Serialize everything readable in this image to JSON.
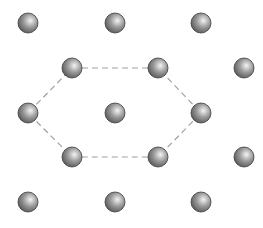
{
  "diagram": {
    "title": "",
    "atom_radius": 10,
    "atoms": [
      {
        "x": 28,
        "y": 23
      },
      {
        "x": 115,
        "y": 23
      },
      {
        "x": 201,
        "y": 23
      },
      {
        "x": 72,
        "y": 68
      },
      {
        "x": 158,
        "y": 68
      },
      {
        "x": 244,
        "y": 68
      },
      {
        "x": 28,
        "y": 113
      },
      {
        "x": 115,
        "y": 113
      },
      {
        "x": 201,
        "y": 113
      },
      {
        "x": 72,
        "y": 157
      },
      {
        "x": 158,
        "y": 157
      },
      {
        "x": 244,
        "y": 157
      },
      {
        "x": 28,
        "y": 202
      },
      {
        "x": 115,
        "y": 202
      },
      {
        "x": 201,
        "y": 202
      }
    ],
    "hexagon": {
      "points": "72,68 158,68 201,113 158,157 72,157 28,113",
      "stroke": "#a0a0a0",
      "dash": "6,4"
    },
    "colors": {
      "atom_light": "#f4f4f4",
      "atom_mid": "#9a9a9a",
      "atom_dark": "#4a4a4a",
      "atom_outline": "#3a3a3a"
    }
  }
}
